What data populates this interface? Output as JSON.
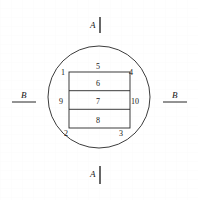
{
  "figure": {
    "caption_hidden": "",
    "stroke_color": "#262626",
    "background_color": "#ffffff",
    "section_markers": [
      {
        "id": "A-top",
        "label": "A",
        "orientation": "vertical",
        "position": "top"
      },
      {
        "id": "A-bottom",
        "label": "A",
        "orientation": "vertical",
        "position": "bottom"
      },
      {
        "id": "B-left",
        "label": "B",
        "orientation": "horizontal",
        "position": "left"
      },
      {
        "id": "B-right",
        "label": "B",
        "orientation": "horizontal",
        "position": "right"
      }
    ],
    "region_labels": [
      {
        "id": "r1",
        "text": "1",
        "x": 62,
        "y": 73
      },
      {
        "id": "r2",
        "text": "2",
        "x": 65,
        "y": 135
      },
      {
        "id": "r3",
        "text": "3",
        "x": 120,
        "y": 135
      },
      {
        "id": "r4",
        "text": "4",
        "x": 131,
        "y": 73
      },
      {
        "id": "r5",
        "text": "5",
        "x": 95,
        "y": 68
      },
      {
        "id": "r6",
        "text": "6",
        "x": 95,
        "y": 85
      },
      {
        "id": "r7",
        "text": "7",
        "x": 95,
        "y": 103
      },
      {
        "id": "r8",
        "text": "8",
        "x": 95,
        "y": 122
      },
      {
        "id": "r9",
        "text": "9",
        "x": 61,
        "y": 100
      },
      {
        "id": "r10",
        "text": "10",
        "x": 129,
        "y": 100
      }
    ],
    "geometry": {
      "circle": {
        "cx": 99,
        "cy": 97,
        "r": 51
      },
      "rectangle": {
        "x": 69,
        "y": 72,
        "width": 61,
        "height": 56
      },
      "divider_y_values": [
        90.7,
        109.3
      ]
    }
  }
}
